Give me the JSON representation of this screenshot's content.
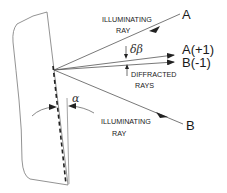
{
  "diagram": {
    "title": "",
    "labels": {
      "ray_a_end": "A",
      "ray_b_end": "B",
      "diffracted_a": "A(+1)",
      "diffracted_b": "B(-1)",
      "illuminating_top_line1": "ILLUMINATING",
      "illuminating_top_line2": "RAY",
      "illuminating_bottom_line1": "ILLUMINATING",
      "illuminating_bottom_line2": "RAY",
      "diffracted_line1": "DIFFRACTED",
      "diffracted_line2": "RAYS",
      "delta_beta": "δβ",
      "alpha": "α"
    },
    "colors": {
      "line": "#555555",
      "text": "#1a1a1a",
      "background": "#ffffff"
    }
  }
}
